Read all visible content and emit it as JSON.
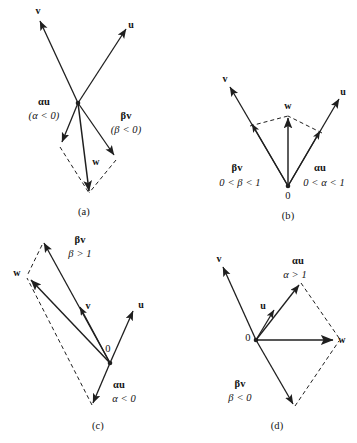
{
  "figure": {
    "stroke_color": "#1f1f1f",
    "background": "#ffffff"
  },
  "panels": [
    {
      "id": "a",
      "caption": "(a)",
      "labels": {
        "u": "u",
        "v": "v",
        "w": "w",
        "alpha_u": "αu",
        "alpha_cond": "(α < 0)",
        "beta_v": "βv",
        "beta_cond": "(β < 0)"
      }
    },
    {
      "id": "b",
      "caption": "(b)",
      "labels": {
        "u": "u",
        "v": "v",
        "w": "w",
        "origin": "0",
        "alpha_u": "αu",
        "alpha_cond": "0 < α < 1",
        "beta_v": "βv",
        "beta_cond": "0 < β < 1"
      }
    },
    {
      "id": "c",
      "caption": "(c)",
      "labels": {
        "u": "u",
        "v": "v",
        "w": "w",
        "origin": "0",
        "alpha_u": "αu",
        "alpha_cond": "α < 0",
        "beta_v": "βv",
        "beta_cond": "β > 1"
      }
    },
    {
      "id": "d",
      "caption": "(d)",
      "labels": {
        "u": "u",
        "v": "v",
        "w": "w",
        "origin": "0",
        "alpha_u": "αu",
        "alpha_cond": "α > 1",
        "beta_v": "βv",
        "beta_cond": "β < 0"
      }
    }
  ]
}
